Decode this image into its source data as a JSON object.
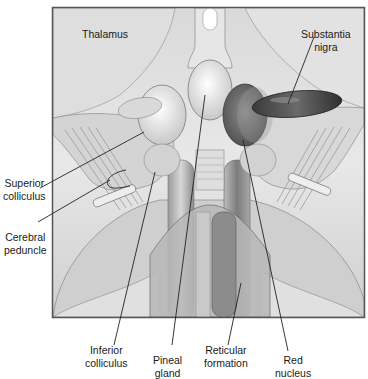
{
  "figure": {
    "colors": {
      "frame": "#555555",
      "tissue_light": "#e6e6e6",
      "tissue_mid": "#c4c4c4",
      "tissue_dark": "#8a8a8a",
      "substantia_nigra": "#555555",
      "red_nucleus": "#7a7a7a",
      "leader_line": "#222222",
      "text": "#1a1a1a"
    }
  },
  "labels": {
    "thalamus": "Thalamus",
    "substantia_nigra": "Substantia\nnigra",
    "superior_colliculus": "Superior\ncolliculus",
    "cerebral_peduncle": "Cerebral\npeduncle",
    "inferior_colliculus": "Inferior\ncolliculus",
    "pineal_gland": "Pineal\ngland",
    "reticular_formation": "Reticular\nformation",
    "red_nucleus": "Red\nnucleus"
  }
}
